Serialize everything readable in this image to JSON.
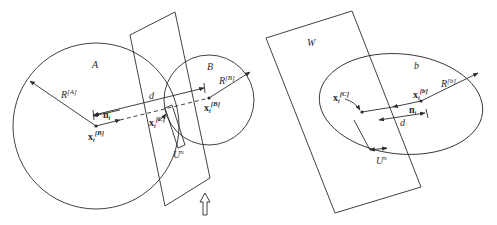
{
  "figure": {
    "left_panel": {
      "region_A_label": "A",
      "region_B_label": "B",
      "radius_A_label": "R",
      "radius_A_sup": "[A]",
      "radius_B_label": "R",
      "radius_B_sup": "[B]",
      "distance_label": "d",
      "normal_label": "n",
      "normal_sub": "i",
      "center_A_label": "x",
      "center_A_sub": "i",
      "center_A_sup": "[B]",
      "center_B_label": "x",
      "center_B_sub": "i",
      "center_B_sup": "[B]",
      "contact_label": "x",
      "contact_sub": "i",
      "contact_sup": "[C]",
      "overlap_label": "U",
      "overlap_sup": "n",
      "arrow_icon": "up-arrow"
    },
    "right_panel": {
      "wall_label": "W",
      "particle_label": "b",
      "radius_label": "R",
      "radius_sup": "[b]",
      "center_label": "x",
      "center_sub": "i",
      "center_sup": "[b]",
      "contact_label": "x",
      "contact_sub": "i",
      "contact_sup": "[C]",
      "normal_label": "n",
      "normal_sub": "i",
      "distance_label": "d",
      "overlap_label": "U",
      "overlap_sup": "n"
    }
  }
}
